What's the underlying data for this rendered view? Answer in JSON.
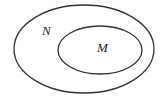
{
  "diagram": {
    "type": "venn",
    "sets": [
      {
        "label": "N",
        "role": "outer"
      },
      {
        "label": "M",
        "role": "inner subset"
      }
    ],
    "relation": "M ⊂ N"
  },
  "colors": {
    "stroke": "#333333",
    "background": "#ffffff",
    "text": "#222222"
  }
}
